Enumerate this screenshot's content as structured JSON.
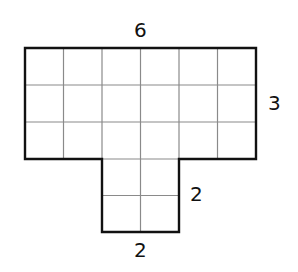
{
  "figure": {
    "type": "composite-rectangle-area",
    "shape": "T-shape made of unit squares",
    "top_rectangle": {
      "width_units": 6,
      "height_units": 3
    },
    "bottom_rectangle": {
      "width_units": 2,
      "height_units": 2
    },
    "labels": {
      "top_width": "6",
      "top_height": "3",
      "stem_height": "2",
      "stem_width": "2"
    },
    "colors": {
      "outline": "#111111",
      "grid": "#8a8a8a",
      "background": "#ffffff"
    }
  }
}
